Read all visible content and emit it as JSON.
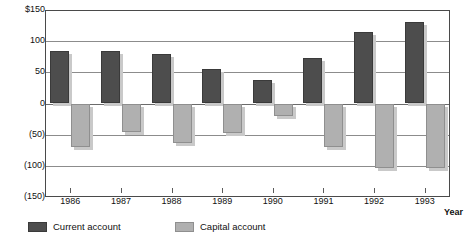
{
  "chart_data": {
    "type": "bar",
    "title": "",
    "xlabel": "Year",
    "ylabel": "",
    "categories": [
      "1986",
      "1987",
      "1988",
      "1989",
      "1990",
      "1991",
      "1992",
      "1993"
    ],
    "series": [
      {
        "name": "Current account",
        "color": "#4d4d4d",
        "values": [
          85,
          85,
          79,
          56,
          37,
          73,
          115,
          130
        ]
      },
      {
        "name": "Capital account",
        "color": "#b0b0b0",
        "values": [
          -70,
          -46,
          -63,
          -48,
          -20,
          -70,
          -104,
          -103
        ]
      }
    ],
    "ylim": [
      -150,
      150
    ],
    "yticks": [
      150,
      100,
      50,
      0,
      -50,
      -100,
      -150
    ],
    "ytick_labels": [
      "$150",
      "100",
      "50",
      "0",
      "(50)",
      "(100)",
      "(150)"
    ],
    "grid": true,
    "legend_position": "bottom-left"
  },
  "legend": {
    "items": [
      {
        "label": "Current account"
      },
      {
        "label": "Capital account"
      }
    ]
  },
  "axis": {
    "x_title": "Year"
  }
}
